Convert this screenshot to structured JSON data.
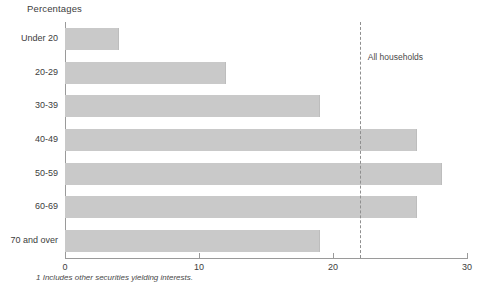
{
  "chart_data": {
    "type": "bar",
    "orientation": "horizontal",
    "title": "Percentages",
    "xlabel": "",
    "ylabel": "",
    "xlim": [
      0,
      30
    ],
    "xticks": [
      0,
      10,
      20,
      30
    ],
    "xtick_labels": [
      "0",
      "10",
      "20",
      "30"
    ],
    "grid": false,
    "legend": null,
    "categories": [
      "Under 20",
      "20-29",
      "30-39",
      "40-49",
      "50-59",
      "60-69",
      "70 and over"
    ],
    "values": [
      4.0,
      12.0,
      19.0,
      26.3,
      28.1,
      26.3,
      19.0
    ],
    "bar_color": "#c9c9c9",
    "annotations": [
      {
        "name": "all-households-reference",
        "label": "All households",
        "value": 22.0,
        "style": "dashed-vertical-line"
      }
    ],
    "footnote": "Includes other securities yielding interests.",
    "footnote_marker": "1"
  },
  "axis": {
    "axis_color": "#9a9a9a"
  }
}
